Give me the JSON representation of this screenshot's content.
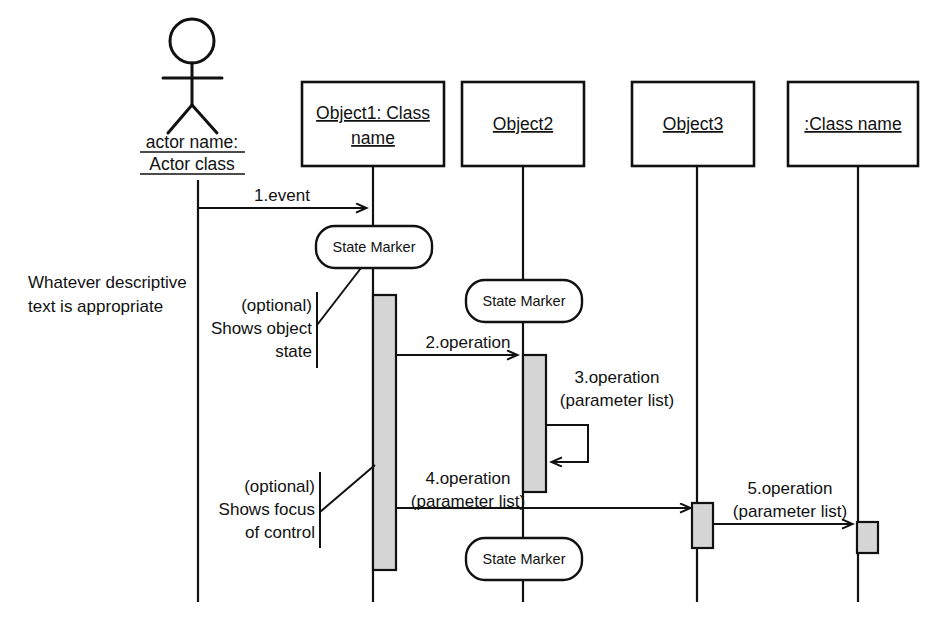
{
  "diagram": {
    "type": "uml-sequence-diagram",
    "background_color": "#ffffff",
    "line_color": "#111111",
    "activation_fill": "#d6d6d6"
  },
  "actor": {
    "name_line1": "actor name:",
    "name_line2": "Actor class"
  },
  "participants": [
    {
      "id": "object1",
      "label_line1": "Object1: Class",
      "label_line2": "name"
    },
    {
      "id": "object2",
      "label_line1": "Object2",
      "label_line2": ""
    },
    {
      "id": "object3",
      "label_line1": "Object3",
      "label_line2": ""
    },
    {
      "id": "classname",
      "label_line1": ":Class name",
      "label_line2": ""
    }
  ],
  "messages": [
    {
      "id": "m1",
      "label_line1": "1.event",
      "label_line2": ""
    },
    {
      "id": "m2",
      "label_line1": "2.operation",
      "label_line2": ""
    },
    {
      "id": "m3",
      "label_line1": "3.operation",
      "label_line2": "(parameter list)"
    },
    {
      "id": "m4",
      "label_line1": "4.operation",
      "label_line2": "(parameter list)"
    },
    {
      "id": "m5",
      "label_line1": "5.operation",
      "label_line2": "(parameter list)"
    }
  ],
  "state_markers": [
    {
      "id": "sm1",
      "label": "State Marker"
    },
    {
      "id": "sm2",
      "label": "State Marker"
    },
    {
      "id": "sm3",
      "label": "State Marker"
    }
  ],
  "notes": {
    "descriptive": {
      "line1": "Whatever descriptive",
      "line2": "text is appropriate"
    },
    "object_state": {
      "line1": "(optional)",
      "line2": "Shows object",
      "line3": "state"
    },
    "focus_of_control": {
      "line1": "(optional)",
      "line2": "Shows focus",
      "line3": "of control"
    }
  }
}
